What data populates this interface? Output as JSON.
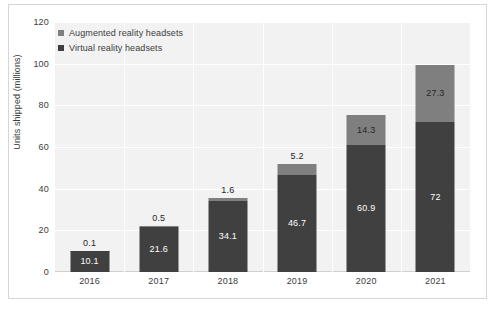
{
  "chart_data": {
    "type": "bar",
    "subtype": "stacked-column",
    "title": "",
    "xlabel": "",
    "ylabel": "Units shipped (millions)",
    "categories": [
      "2016",
      "2017",
      "2018",
      "2019",
      "2020",
      "2021"
    ],
    "series": [
      {
        "name": "Virtual reality headsets",
        "color": "#404040",
        "values": [
          10.1,
          21.6,
          34.1,
          46.7,
          60.9,
          72
        ],
        "labels": [
          "10.1",
          "21.6",
          "34.1",
          "46.7",
          "60.9",
          "72"
        ]
      },
      {
        "name": "Augmented reality headsets",
        "color": "#7f7f7f",
        "values": [
          0.1,
          0.5,
          1.6,
          5.2,
          14.3,
          27.3
        ],
        "labels": [
          "0.1",
          "0.5",
          "1.6",
          "5.2",
          "14.3",
          "27.3"
        ]
      }
    ],
    "stack_order": [
      "Virtual reality headsets",
      "Augmented reality headsets"
    ],
    "ylim": [
      0,
      120
    ],
    "yticks": [
      0,
      20,
      40,
      60,
      80,
      100,
      120
    ],
    "ytick_labels": [
      "0",
      "20",
      "40",
      "60",
      "80",
      "100",
      "120"
    ],
    "grid": {
      "horizontal": true,
      "vertical": true,
      "color": "#ffffff"
    },
    "plot_background": "#f2f2f2",
    "legend": {
      "position": "top-left-inside",
      "entries": [
        {
          "label": "Augmented reality headsets",
          "color": "#7f7f7f"
        },
        {
          "label": "Virtual reality headsets",
          "color": "#404040"
        }
      ]
    }
  }
}
